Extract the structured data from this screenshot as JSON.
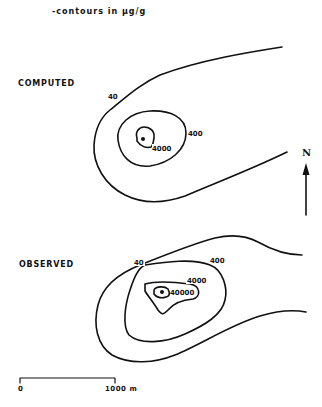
{
  "legend": {
    "text": "-contours in µg/g"
  },
  "panels": [
    {
      "label": "COMPUTED",
      "contours": [
        {
          "value": "40",
          "label": "40"
        },
        {
          "value": "400",
          "label": "400"
        },
        {
          "value": "4000",
          "label": "4000"
        }
      ]
    },
    {
      "label": "OBSERVED",
      "contours": [
        {
          "value": "40",
          "label": "40"
        },
        {
          "value": "400",
          "label": "400"
        },
        {
          "value": "4000",
          "label": "4000"
        },
        {
          "value": "40000",
          "label": "40000"
        }
      ]
    }
  ],
  "north_arrow": {
    "label": "N"
  },
  "scale_bar": {
    "start_label": "0",
    "end_label": "1000 m"
  },
  "colors": {
    "line": "#111111",
    "background": "#ffffff"
  }
}
